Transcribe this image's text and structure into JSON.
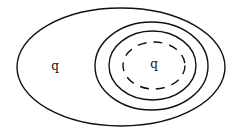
{
  "diagram": {
    "type": "nested-ellipses",
    "stroke_color": "#111111",
    "background": "#ffffff",
    "labels": {
      "outer_region": "q",
      "inner_region": "q"
    },
    "shapes": [
      {
        "name": "outer-ellipse",
        "style": "solid"
      },
      {
        "name": "second-ellipse",
        "style": "solid"
      },
      {
        "name": "third-ellipse",
        "style": "solid"
      },
      {
        "name": "inner-dashed-ellipse",
        "style": "dashed"
      }
    ]
  }
}
